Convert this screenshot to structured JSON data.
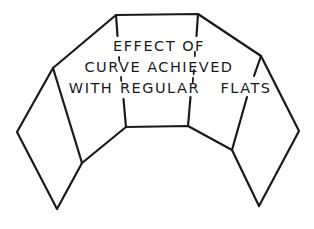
{
  "diagram": {
    "type": "line-drawing",
    "label": {
      "line1": "EFFECT OF",
      "line2": "CURVE ACHIEVED",
      "line3_part1": "WITH",
      "line3_part2": "REGULAR",
      "line3_part3": "FLATS"
    },
    "panels": [
      {
        "name": "far-left-flat"
      },
      {
        "name": "left-flat"
      },
      {
        "name": "center-flat"
      },
      {
        "name": "right-flat"
      },
      {
        "name": "far-right-flat"
      }
    ],
    "colors": {
      "ink": "#1a1a1a",
      "background": "#ffffff"
    }
  }
}
